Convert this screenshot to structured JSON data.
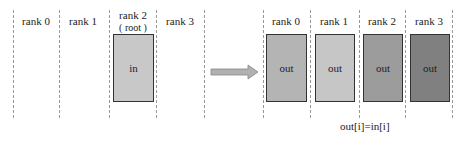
{
  "before": {
    "ranks": [
      {
        "label": "rank 0"
      },
      {
        "label": "rank 1"
      },
      {
        "label": "rank 2",
        "sub": "( root )",
        "buffer": "in",
        "color": "#c8c8c8"
      },
      {
        "label": "rank 3"
      }
    ]
  },
  "after": {
    "ranks": [
      {
        "label": "rank 0",
        "buffer": "out",
        "color": "#b4b4b4"
      },
      {
        "label": "rank 1",
        "buffer": "out",
        "color": "#c6c6c6"
      },
      {
        "label": "rank 2",
        "buffer": "out",
        "color": "#9c9c9c"
      },
      {
        "label": "rank 3",
        "buffer": "out",
        "color": "#808080"
      }
    ]
  },
  "equation": "out[i]=in[i]",
  "arrow_color": "#b0b0b0"
}
